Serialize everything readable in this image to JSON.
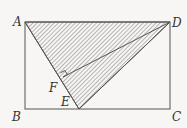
{
  "figure": {
    "type": "geometry",
    "shape": "rectangle ABCD with triangle ADE shaded and perpendicular DF to AE",
    "points": {
      "A": {
        "label": "A",
        "x": 25,
        "y": 22
      },
      "B": {
        "label": "B",
        "x": 25,
        "y": 109
      },
      "C": {
        "label": "C",
        "x": 170,
        "y": 109
      },
      "D": {
        "label": "D",
        "x": 170,
        "y": 22
      },
      "E": {
        "label": "E",
        "x": 79,
        "y": 109
      },
      "F": {
        "label": "F",
        "x": 63,
        "y": 77
      }
    },
    "segments": [
      "AB",
      "BC",
      "CD",
      "DA",
      "AE",
      "DE",
      "DF"
    ],
    "shaded_region": "triangle ADE",
    "right_angle_at": "F",
    "colors": {
      "line": "#555555",
      "hatch": "#666666",
      "background": "#f7f6f4"
    }
  }
}
